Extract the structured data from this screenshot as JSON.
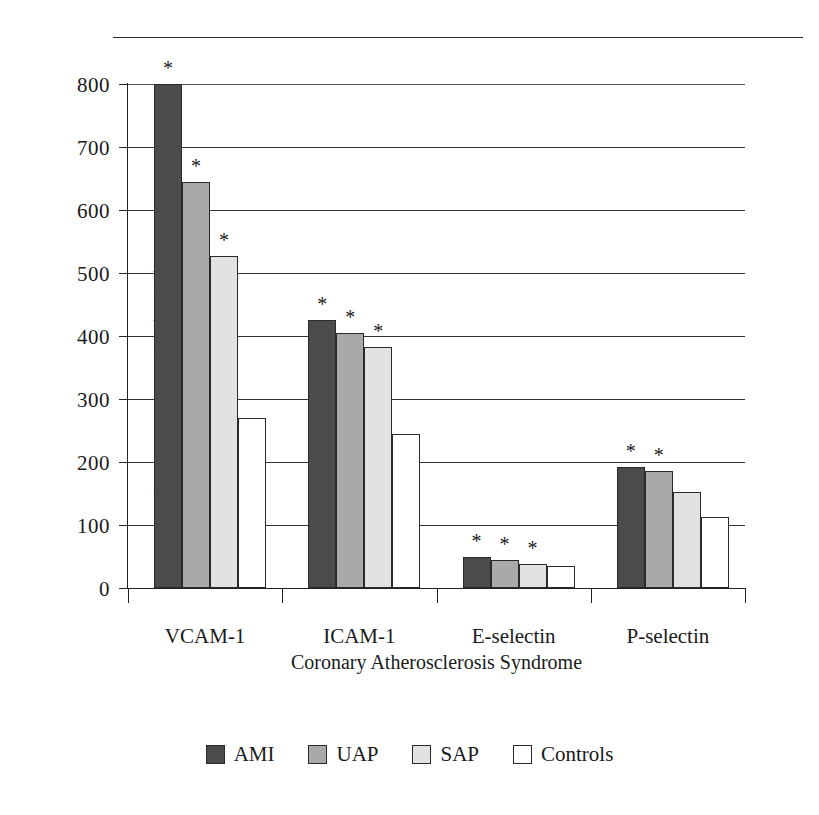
{
  "chart_data": {
    "type": "bar",
    "title": "",
    "xlabel": "Coronary Atherosclerosis Syndrome",
    "ylabel": "Serum concentration (ng/ml)",
    "categories": [
      "VCAM-1",
      "ICAM-1",
      "E-selectin",
      "P-selectin"
    ],
    "series": [
      {
        "name": "AMI",
        "color": "#4b4b4b",
        "values": [
          800,
          425,
          50,
          192
        ]
      },
      {
        "name": "UAP",
        "color": "#a9a9a9",
        "values": [
          645,
          405,
          45,
          186
        ]
      },
      {
        "name": "SAP",
        "color": "#e2e2e2",
        "values": [
          527,
          383,
          38,
          152
        ]
      },
      {
        "name": "Controls",
        "color": "#ffffff",
        "values": [
          270,
          245,
          35,
          113
        ]
      }
    ],
    "significance_marker": "*",
    "significance": [
      [
        true,
        true,
        true,
        false
      ],
      [
        true,
        true,
        true,
        false
      ],
      [
        true,
        true,
        true,
        false
      ],
      [
        true,
        true,
        false,
        false
      ]
    ],
    "ylim": [
      0,
      800
    ],
    "yticks": [
      0,
      100,
      200,
      300,
      400,
      500,
      600,
      700,
      800
    ],
    "ytick_labels": [
      "0",
      "100",
      "200",
      "300",
      "400",
      "500",
      "600",
      "700",
      "800"
    ],
    "grid": true,
    "grid_axis": "y",
    "legend_position": "bottom"
  }
}
